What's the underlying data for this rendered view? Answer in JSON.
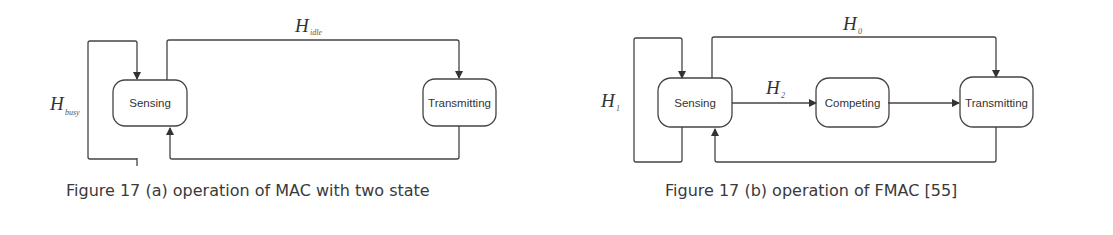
{
  "figure_a": {
    "caption": "Figure 17 (a) operation of MAC with two state",
    "states": [
      {
        "label": "Sensing"
      },
      {
        "label": "Transmitting"
      }
    ],
    "transitions": {
      "busy": {
        "symbol": "H",
        "subscript": "busy"
      },
      "idle": {
        "symbol": "H",
        "subscript": "idle"
      }
    }
  },
  "figure_b": {
    "caption": "Figure 17 (b) operation of FMAC [55]",
    "states": [
      {
        "label": "Sensing"
      },
      {
        "label": "Competing"
      },
      {
        "label": "Transmitting"
      }
    ],
    "transitions": {
      "h1": {
        "symbol": "H",
        "subscript": "1"
      },
      "h0": {
        "symbol": "H",
        "subscript": "0"
      },
      "h2": {
        "symbol": "H",
        "subscript": "2"
      }
    }
  },
  "colors": {
    "line": "#444444",
    "text": "#333333"
  }
}
